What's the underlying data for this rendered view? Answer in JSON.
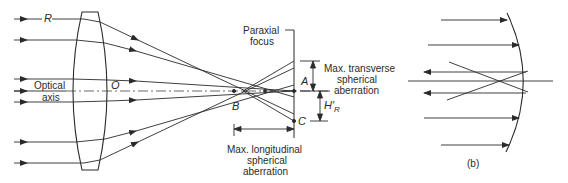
{
  "figure_a": {
    "ray_label": "R",
    "optical_axis_label_1": "Optical",
    "optical_axis_label_2": "axis",
    "center_label": "O",
    "paraxial_focus_1": "Paraxial",
    "paraxial_focus_2": "focus",
    "point_a": "A",
    "point_b": "B",
    "point_c": "C",
    "height_label": "H′",
    "height_sub": "R",
    "transverse_1": "Max. transverse",
    "transverse_2": "spherical",
    "transverse_3": "aberration",
    "longitudinal_1": "Max. longitudinal",
    "longitudinal_2": "spherical",
    "longitudinal_3": "aberration"
  },
  "figure_b": {
    "caption": "(b)"
  },
  "colors": {
    "line": "#2a2a2a",
    "background": "#ffffff"
  }
}
